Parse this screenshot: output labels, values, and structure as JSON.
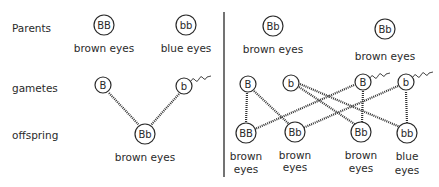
{
  "row_labels": {
    "parents": "Parents",
    "gametes": "gametes",
    "offspring": "offspring"
  },
  "left_cross": {
    "parents": [
      {
        "genotype": "BB",
        "phenotype": "brown eyes"
      },
      {
        "genotype": "bb",
        "phenotype": "blue eyes"
      }
    ],
    "gametes": [
      {
        "allele": "B",
        "sperm_tail": false
      },
      {
        "allele": "b",
        "sperm_tail": true
      }
    ],
    "offspring": [
      {
        "genotype": "Bb",
        "phenotype": "brown eyes"
      }
    ]
  },
  "right_cross": {
    "parents": [
      {
        "genotype": "Bb",
        "phenotype": "brown eyes"
      },
      {
        "genotype": "Bb",
        "phenotype": "brown eyes"
      }
    ],
    "gametes": [
      {
        "allele": "B",
        "sperm_tail": false
      },
      {
        "allele": "b",
        "sperm_tail": false
      },
      {
        "allele": "B",
        "sperm_tail": true
      },
      {
        "allele": "b",
        "sperm_tail": true
      }
    ],
    "offspring": [
      {
        "genotype": "BB",
        "phenotype_line1": "brown",
        "phenotype_line2": "eyes"
      },
      {
        "genotype": "Bb",
        "phenotype_line1": "brown",
        "phenotype_line2": "eyes"
      },
      {
        "genotype": "Bb",
        "phenotype_line1": "brown",
        "phenotype_line2": "eyes"
      },
      {
        "genotype": "bb",
        "phenotype_line1": "blue",
        "phenotype_line2": "eyes"
      }
    ]
  }
}
